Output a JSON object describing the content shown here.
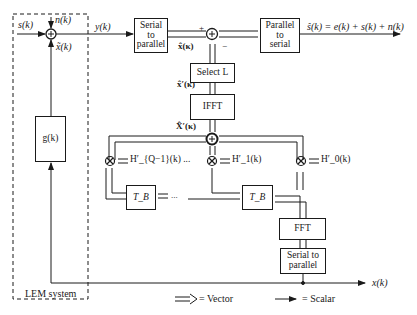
{
  "diagram": {
    "lem_system": {
      "label": "LEM system"
    },
    "signals": {
      "s": "s(k)",
      "n": "n(k)",
      "y": "y(k)",
      "x_tilde": "x̃(k)",
      "x": "x(k)",
      "output": "ŝ(k) = e(k) + s(k) + n(k)",
      "x_hat": "x̂(κ)",
      "x_hat_prime": "x̂′(κ)",
      "X_hat_prime": "X̂′(κ)",
      "plus": "+",
      "minus": "−"
    },
    "blocks": {
      "g": "g(k)",
      "serial_to_parallel_top": [
        "Serial",
        "to",
        "parallel"
      ],
      "parallel_to_serial": [
        "Parallel",
        "to",
        "serial"
      ],
      "select": "Select L",
      "ifft": "IFFT",
      "fft": "FFT",
      "serial_to_parallel_bottom": [
        "Serial to",
        "parallel"
      ],
      "delay_left": "T_B",
      "delay_right": "T_B"
    },
    "filters": {
      "h_q1": "H′_{Q−1}(k) ...",
      "h_1": "H′_1(k)",
      "h_0": "H′_0(k)",
      "ellipsis": "..."
    },
    "legend": {
      "vector": "= Vector",
      "scalar": "= Scalar"
    }
  }
}
